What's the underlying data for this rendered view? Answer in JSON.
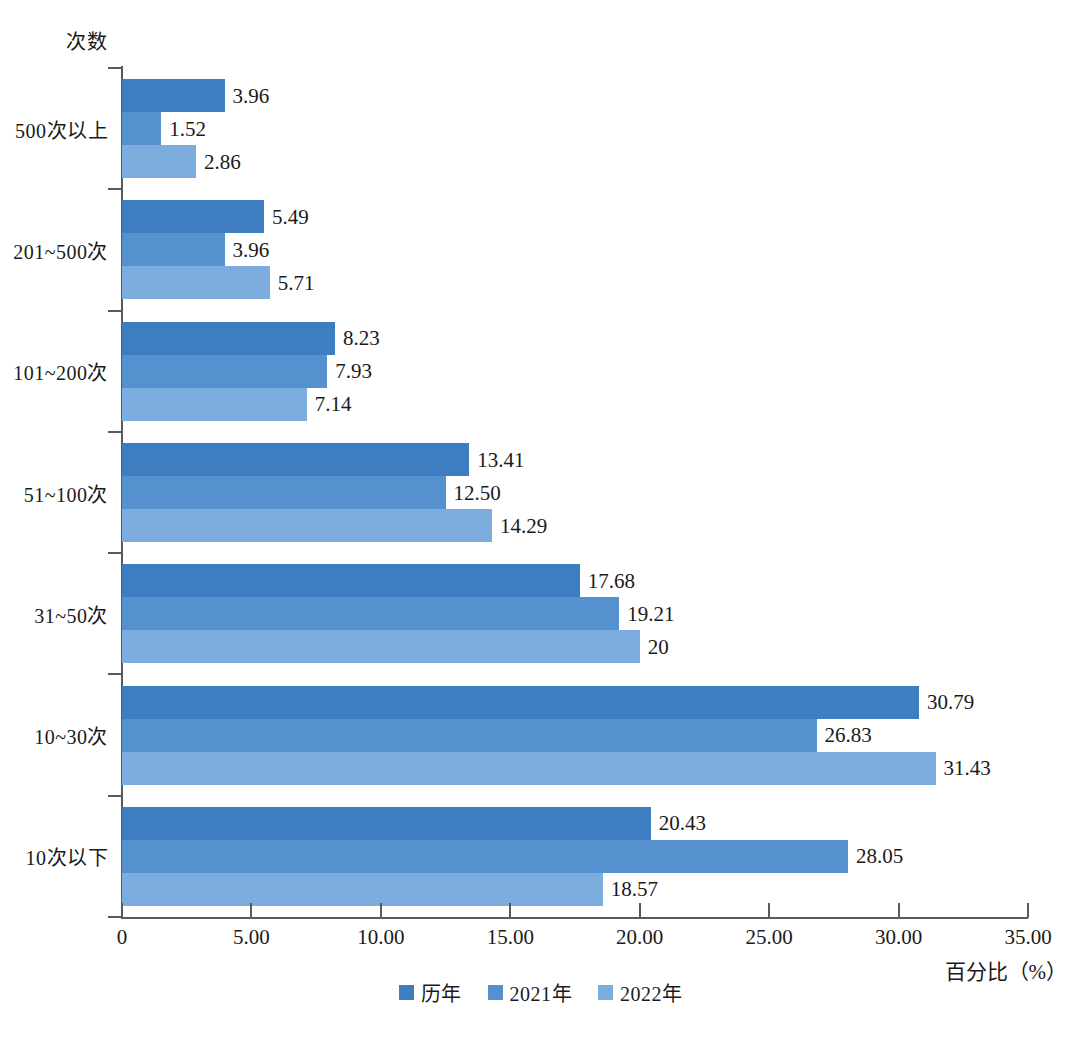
{
  "chart_data": {
    "type": "bar",
    "orientation": "horizontal",
    "title": "",
    "ylabel": "次数",
    "xlabel": "百分比（%）",
    "xlim": [
      0,
      35
    ],
    "xticks": [
      0,
      5,
      10,
      15,
      20,
      25,
      30,
      35
    ],
    "xticklabels": [
      "0",
      "5.00",
      "10.00",
      "15.00",
      "20.00",
      "25.00",
      "30.00",
      "35.00"
    ],
    "grid": false,
    "legend_position": "bottom-center",
    "categories": [
      "500次以上",
      "201~500次",
      "101~200次",
      "51~100次",
      "31~50次",
      "10~30次",
      "10次以下"
    ],
    "series": [
      {
        "name": "历年",
        "color": "#3d7dc0",
        "values": [
          3.96,
          5.49,
          8.23,
          13.41,
          17.68,
          30.79,
          20.43
        ],
        "labels": [
          "3.96",
          "5.49",
          "8.23",
          "13.41",
          "17.68",
          "30.79",
          "20.43"
        ]
      },
      {
        "name": "2021年",
        "color": "#5590cf",
        "values": [
          1.52,
          3.96,
          7.93,
          12.5,
          19.21,
          26.83,
          28.05
        ],
        "labels": [
          "1.52",
          "3.96",
          "7.93",
          "12.50",
          "19.21",
          "26.83",
          "28.05"
        ]
      },
      {
        "name": "2022年",
        "color": "#7cadde",
        "values": [
          2.86,
          5.71,
          7.14,
          14.29,
          20.0,
          31.43,
          18.57
        ],
        "labels": [
          "2.86",
          "5.71",
          "7.14",
          "14.29",
          "20",
          "31.43",
          "18.57"
        ]
      }
    ]
  },
  "axis": {
    "y_title": "次数",
    "x_title": "百分比（%）"
  },
  "legend": {
    "items": [
      {
        "label": "历年",
        "color": "#3d7dc0"
      },
      {
        "label": "2021年",
        "color": "#5590cf"
      },
      {
        "label": "2022年",
        "color": "#7cadde"
      }
    ]
  }
}
